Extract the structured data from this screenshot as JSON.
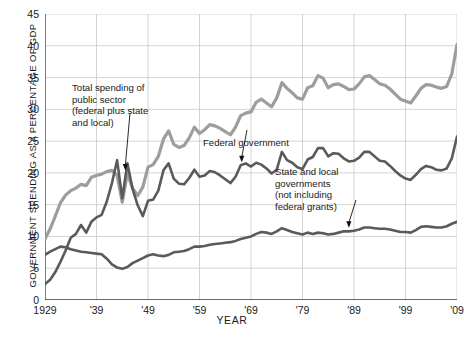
{
  "chart_data": {
    "type": "line",
    "title": "",
    "xlabel": "YEAR",
    "ylabel": "GOVERNMENT SPENDING AS A PERCENTAGE OF GDP",
    "xlim": [
      1929,
      2009
    ],
    "ylim": [
      0,
      45
    ],
    "grid": true,
    "legend_position": "inline-annotations",
    "yticks": [
      0,
      5,
      10,
      15,
      20,
      25,
      30,
      35,
      40,
      45
    ],
    "yticklabels": [
      "0",
      "5",
      "10",
      "15",
      "20",
      "25",
      "30",
      "35",
      "40",
      "45"
    ],
    "xticks": [
      1929,
      1939,
      1949,
      1959,
      1969,
      1979,
      1989,
      1999,
      2009
    ],
    "xticklabels": [
      "1929",
      "'39",
      "'49",
      "'59",
      "'69",
      "'79",
      "'89",
      "'99",
      "'09"
    ],
    "series": [
      {
        "name": "Total spending of public sector (federal plus state and local)",
        "color": "#9d9d9d",
        "x": [
          1929,
          1930,
          1931,
          1932,
          1933,
          1934,
          1935,
          1936,
          1937,
          1938,
          1939,
          1940,
          1941,
          1942,
          1943,
          1944,
          1945,
          1946,
          1947,
          1948,
          1949,
          1950,
          1951,
          1952,
          1953,
          1954,
          1955,
          1956,
          1957,
          1958,
          1959,
          1960,
          1961,
          1962,
          1963,
          1964,
          1965,
          1966,
          1967,
          1968,
          1969,
          1970,
          1971,
          1972,
          1973,
          1974,
          1975,
          1976,
          1977,
          1978,
          1979,
          1980,
          1981,
          1982,
          1983,
          1984,
          1985,
          1986,
          1987,
          1988,
          1989,
          1990,
          1991,
          1992,
          1993,
          1994,
          1995,
          1996,
          1997,
          1998,
          1999,
          2000,
          2001,
          2002,
          2003,
          2004,
          2005,
          2006,
          2007,
          2008,
          2009
        ],
        "values": [
          9.6,
          11.2,
          13.2,
          15.3,
          16.5,
          17.2,
          17.6,
          18.2,
          18.0,
          19.3,
          19.6,
          19.8,
          20.2,
          20.4,
          19.6,
          15.4,
          19.9,
          17.6,
          16.4,
          17.8,
          20.9,
          21.3,
          22.6,
          25.3,
          26.6,
          24.5,
          24.0,
          24.3,
          25.5,
          27.2,
          26.2,
          26.8,
          27.6,
          27.4,
          27.0,
          26.5,
          26.0,
          27.2,
          29.0,
          29.4,
          29.6,
          31.1,
          31.6,
          31.0,
          30.4,
          31.8,
          34.2,
          33.3,
          32.6,
          31.8,
          31.6,
          33.4,
          33.7,
          35.3,
          34.9,
          33.4,
          33.9,
          34.0,
          33.6,
          33.1,
          33.2,
          34.0,
          35.1,
          35.3,
          34.7,
          34.0,
          33.8,
          33.2,
          32.4,
          31.6,
          31.3,
          31.0,
          32.1,
          33.3,
          33.9,
          33.8,
          33.5,
          33.3,
          33.6,
          35.6,
          40.2
        ]
      },
      {
        "name": "Federal government",
        "color": "#5a5a5a",
        "x": [
          1929,
          1930,
          1931,
          1932,
          1933,
          1934,
          1935,
          1936,
          1937,
          1938,
          1939,
          1940,
          1941,
          1942,
          1943,
          1944,
          1945,
          1946,
          1947,
          1948,
          1949,
          1950,
          1951,
          1952,
          1953,
          1954,
          1955,
          1956,
          1957,
          1958,
          1959,
          1960,
          1961,
          1962,
          1963,
          1964,
          1965,
          1966,
          1967,
          1968,
          1969,
          1970,
          1971,
          1972,
          1973,
          1974,
          1975,
          1976,
          1977,
          1978,
          1979,
          1980,
          1981,
          1982,
          1983,
          1984,
          1985,
          1986,
          1987,
          1988,
          1989,
          1990,
          1991,
          1992,
          1993,
          1994,
          1995,
          1996,
          1997,
          1998,
          1999,
          2000,
          2001,
          2002,
          2003,
          2004,
          2005,
          2006,
          2007,
          2008,
          2009
        ],
        "values": [
          2.5,
          3.2,
          4.4,
          6.0,
          7.8,
          9.8,
          10.4,
          11.8,
          10.6,
          12.3,
          13.0,
          13.4,
          15.5,
          18.4,
          22.0,
          16.0,
          21.5,
          17.5,
          14.9,
          13.2,
          15.6,
          15.8,
          17.2,
          20.4,
          21.5,
          19.1,
          18.3,
          18.2,
          19.2,
          20.5,
          19.4,
          19.6,
          20.3,
          20.1,
          19.6,
          19.0,
          18.4,
          19.4,
          21.2,
          21.5,
          21.0,
          21.6,
          21.3,
          20.7,
          19.9,
          20.5,
          23.3,
          22.0,
          21.6,
          20.9,
          20.6,
          22.1,
          22.5,
          23.9,
          23.9,
          22.6,
          23.1,
          23.0,
          22.3,
          21.8,
          21.9,
          22.4,
          23.3,
          23.3,
          22.6,
          21.9,
          21.8,
          21.1,
          20.3,
          19.6,
          19.1,
          18.9,
          19.7,
          20.6,
          21.1,
          20.9,
          20.5,
          20.4,
          20.7,
          22.3,
          25.7
        ]
      },
      {
        "name": "State and local governments (not including federal grants)",
        "color": "#5a5a5a",
        "x": [
          1929,
          1930,
          1931,
          1932,
          1933,
          1934,
          1935,
          1936,
          1937,
          1938,
          1939,
          1940,
          1941,
          1942,
          1943,
          1944,
          1945,
          1946,
          1947,
          1948,
          1949,
          1950,
          1951,
          1952,
          1953,
          1954,
          1955,
          1956,
          1957,
          1958,
          1959,
          1960,
          1961,
          1962,
          1963,
          1964,
          1965,
          1966,
          1967,
          1968,
          1969,
          1970,
          1971,
          1972,
          1973,
          1974,
          1975,
          1976,
          1977,
          1978,
          1979,
          1980,
          1981,
          1982,
          1983,
          1984,
          1985,
          1986,
          1987,
          1988,
          1989,
          1990,
          1991,
          1992,
          1993,
          1994,
          1995,
          1996,
          1997,
          1998,
          1999,
          2000,
          2001,
          2002,
          2003,
          2004,
          2005,
          2006,
          2007,
          2008,
          2009
        ],
        "values": [
          7.1,
          7.6,
          8.0,
          8.4,
          8.3,
          8.0,
          7.8,
          7.6,
          7.5,
          7.4,
          7.3,
          7.2,
          6.5,
          5.6,
          5.1,
          4.9,
          5.2,
          5.8,
          6.2,
          6.6,
          7.0,
          7.2,
          7.0,
          6.9,
          7.1,
          7.5,
          7.6,
          7.7,
          8.0,
          8.4,
          8.4,
          8.5,
          8.7,
          8.8,
          8.9,
          9.0,
          9.1,
          9.3,
          9.6,
          9.8,
          10.0,
          10.4,
          10.7,
          10.6,
          10.4,
          10.8,
          11.3,
          11.0,
          10.7,
          10.5,
          10.3,
          10.6,
          10.4,
          10.6,
          10.5,
          10.3,
          10.4,
          10.6,
          10.8,
          10.8,
          10.9,
          11.1,
          11.4,
          11.4,
          11.3,
          11.2,
          11.2,
          11.1,
          10.9,
          10.7,
          10.7,
          10.6,
          11.0,
          11.5,
          11.6,
          11.5,
          11.4,
          11.4,
          11.6,
          12.0,
          12.3
        ]
      }
    ],
    "annotations": [
      {
        "id": "total",
        "text": "Total spending of\npublic sector\n(federal plus state\nand local)",
        "arrow_to": {
          "x": 1944.6,
          "y": 19.9
        }
      },
      {
        "id": "federal",
        "text": "Federal government",
        "arrow_to": {
          "x": 1967.2,
          "y": 21.2
        }
      },
      {
        "id": "state",
        "text": "State and local\ngovernments\n(not including\nfederal grants)",
        "arrow_to": {
          "x": 1988.0,
          "y": 10.9
        }
      }
    ]
  }
}
